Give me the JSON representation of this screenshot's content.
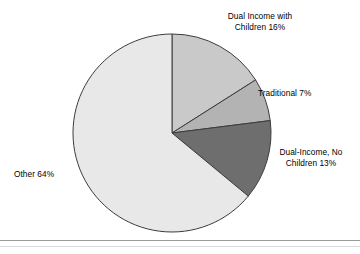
{
  "chart_data": {
    "type": "pie",
    "title": "",
    "legend_position": "outside-labels",
    "start_angle_deg": 0,
    "direction": "clockwise",
    "center": {
      "x": 172,
      "y": 133
    },
    "radius": 99,
    "categories": [
      "Dual Income with Children",
      "Traditional",
      "Dual-Income, No Children",
      "Other"
    ],
    "values": [
      16,
      7,
      13,
      64
    ],
    "value_unit": "%",
    "colors": [
      "#c9c9c9",
      "#b3b3b3",
      "#6e6e6e",
      "#e8e8e8"
    ],
    "stroke_color": "#3c3c3c",
    "slices": [
      {
        "name": "Dual Income with Children",
        "value": 16,
        "color": "#c9c9c9",
        "label_line_1": "Dual Income with",
        "label_line_2": "Children 16%"
      },
      {
        "name": "Traditional",
        "value": 7,
        "color": "#b3b3b3",
        "label_line_1": "Traditional 7%",
        "label_line_2": ""
      },
      {
        "name": "Dual-Income, No Children",
        "value": 13,
        "color": "#6e6e6e",
        "label_line_1": "Dual-Income, No",
        "label_line_2": "Children 13%"
      },
      {
        "name": "Other",
        "value": 64,
        "color": "#e8e8e8",
        "label_line_1": "Other 64%",
        "label_line_2": ""
      }
    ]
  },
  "labels": {
    "dual_income_children": "Dual Income with\nChildren 16%",
    "traditional": "Traditional 7%",
    "dual_income_no_children": "Dual-Income, No\nChildren 13%",
    "other": "Other 64%"
  },
  "colors": {
    "background": "#ffffff",
    "text": "#000000",
    "slice_border": "#3c3c3c",
    "footer_rule": "#9a9a9a"
  }
}
